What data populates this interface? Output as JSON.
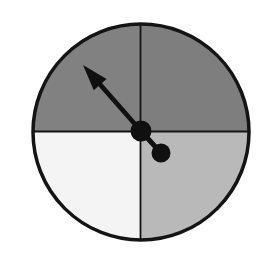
{
  "figure": {
    "name": "spinner-wheel",
    "title": "Four-sector spinner with pointer",
    "background_color": "#ffffff",
    "width": 264,
    "height": 267
  },
  "wheel": {
    "center_x": 141,
    "center_y": 132,
    "radius": 108,
    "outline_color": "#141414",
    "outline_width": 3.5,
    "divider_color": "#141414",
    "divider_width": 1.8,
    "sector_count": 4
  },
  "sectors": [
    {
      "name": "top-left-sector",
      "position": "top-left",
      "label": "",
      "fill": "#818181",
      "start_angle": 180,
      "end_angle": 270
    },
    {
      "name": "top-right-sector",
      "position": "top-right",
      "label": "",
      "fill": "#7e7e7e",
      "start_angle": 270,
      "end_angle": 360
    },
    {
      "name": "bottom-right-sector",
      "position": "bottom-right",
      "label": "",
      "fill": "#b9b9b9",
      "start_angle": 0,
      "end_angle": 90
    },
    {
      "name": "bottom-left-sector",
      "position": "bottom-left",
      "label": "",
      "fill": "#f4f4f4",
      "start_angle": 90,
      "end_angle": 180
    }
  ],
  "pointer": {
    "name": "spinner-arrow",
    "color": "#101010",
    "pivot_x": 141,
    "pivot_y": 131,
    "tip_x": 83,
    "tip_y": 65,
    "shaft_width": 4.6,
    "direction": "up-left",
    "angle_degrees": 131,
    "points_to_sector": "top-left-sector",
    "arrowhead_length": 26,
    "arrowhead_half_width": 8.5
  },
  "hub": {
    "name": "pointer-hub",
    "cx": 141,
    "cy": 131,
    "r": 10.5,
    "fill": "#101010"
  },
  "counterweight": {
    "name": "pointer-counterweight",
    "cx": 161,
    "cy": 153,
    "r": 9.5,
    "fill": "#101010",
    "stub_width": 5
  },
  "chart_data": {
    "type": "pie",
    "title": "",
    "categories": [
      "top-left",
      "top-right",
      "bottom-right",
      "bottom-left"
    ],
    "values": [
      25,
      25,
      25,
      25
    ],
    "colors": [
      "#818181",
      "#7e7e7e",
      "#b9b9b9",
      "#f4f4f4"
    ],
    "legend": "none",
    "grid": false,
    "annotations": [
      "pointer arrow aimed at top-left sector"
    ]
  }
}
